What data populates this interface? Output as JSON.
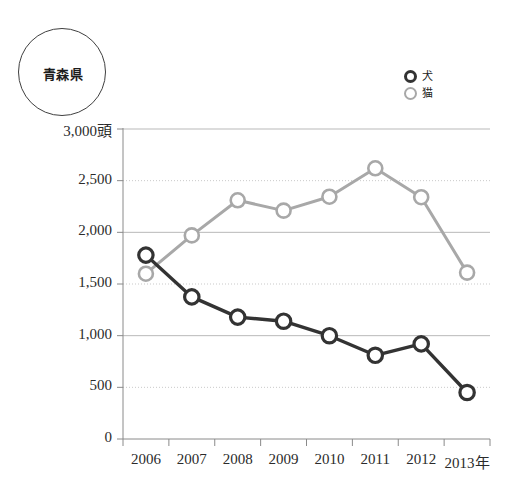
{
  "badge": {
    "label": "青森県"
  },
  "legend": {
    "position": "top-right",
    "entries": [
      {
        "label": "犬",
        "marker": "circle-outline-dark",
        "color": "#333333"
      },
      {
        "label": "猫",
        "marker": "circle-outline-gray",
        "color": "#a8a8a8"
      }
    ]
  },
  "chart_data": {
    "type": "line",
    "title": "青森県",
    "xlabel": "",
    "ylabel": "頭",
    "unit_suffix": "頭",
    "x_axis_suffix": "年",
    "categories": [
      "2006",
      "2007",
      "2008",
      "2009",
      "2010",
      "2011",
      "2012",
      "2013"
    ],
    "x_tick_labels": [
      "2006",
      "2007",
      "2008",
      "2009",
      "2010",
      "2011",
      "2012",
      "2013年"
    ],
    "y_tick_labels": [
      "0",
      "500",
      "1,000",
      "1,500",
      "2,000",
      "2,500",
      "3,000頭"
    ],
    "y_ticks": [
      0,
      500,
      1000,
      1500,
      2000,
      2500,
      3000
    ],
    "ylim": [
      0,
      3000
    ],
    "grid": true,
    "legend_position": "top-right",
    "series": [
      {
        "name": "犬",
        "color": "#333333",
        "marker": "open-circle",
        "values": [
          1780,
          1375,
          1180,
          1140,
          1000,
          810,
          920,
          450
        ]
      },
      {
        "name": "猫",
        "color": "#a8a8a8",
        "marker": "open-circle",
        "values": [
          1600,
          1970,
          2310,
          2210,
          2345,
          2620,
          2340,
          1610
        ]
      }
    ]
  },
  "colors": {
    "dog_line": "#333333",
    "cat_line": "#a8a8a8",
    "grid_solid": "#b9b9b9",
    "grid_dotted": "#c9c9c9",
    "axis": "#8a8a8a",
    "text": "#2b2b2b"
  }
}
